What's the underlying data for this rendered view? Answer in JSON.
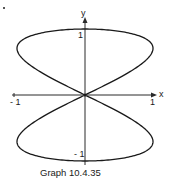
{
  "figure": {
    "caption": "Graph 10.4.35",
    "axis_labels": {
      "x": "x",
      "y": "y"
    },
    "ticks": {
      "x_neg": "- 1",
      "x_pos": "1",
      "y_pos": "1",
      "y_neg": "- 1"
    },
    "colors": {
      "curve": "#1a1a1a",
      "axis": "#2a2a2a",
      "background": "#ffffff"
    }
  },
  "chart_data": {
    "type": "line",
    "title": "Graph 10.4.35",
    "xlabel": "x",
    "ylabel": "y",
    "xlim": [
      -1,
      1
    ],
    "ylim": [
      -1,
      1
    ],
    "x_ticks": [
      -1,
      1
    ],
    "y_ticks": [
      -1,
      1
    ],
    "grid": false,
    "key_points": [
      {
        "t": "0",
        "x": 0,
        "y": 1
      },
      {
        "t": "π/4",
        "x": 1,
        "y": 0.707
      },
      {
        "t": "π/2",
        "x": 0,
        "y": 0
      },
      {
        "t": "3π/4",
        "x": -1,
        "y": -0.707
      },
      {
        "t": "π",
        "x": 0,
        "y": -1
      },
      {
        "t": "5π/4",
        "x": 1,
        "y": -0.707
      },
      {
        "t": "3π/2",
        "x": 0,
        "y": 0
      },
      {
        "t": "7π/4",
        "x": -1,
        "y": 0.707
      }
    ]
  }
}
